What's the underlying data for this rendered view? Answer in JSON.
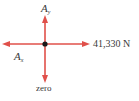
{
  "diagram": {
    "type": "free-body-diagram",
    "arrow_color": "#e0504a",
    "point_color": "#1a1a1a",
    "labels": {
      "up": {
        "symbol": "A",
        "subscript": "y"
      },
      "left": {
        "symbol": "A",
        "subscript": "x"
      },
      "right": "41,330 N",
      "down": "zero"
    },
    "forces": [
      {
        "direction": "up",
        "label": "A_y"
      },
      {
        "direction": "left",
        "label": "A_x"
      },
      {
        "direction": "right",
        "label": "41,330 N"
      },
      {
        "direction": "down",
        "label": "zero"
      }
    ]
  }
}
